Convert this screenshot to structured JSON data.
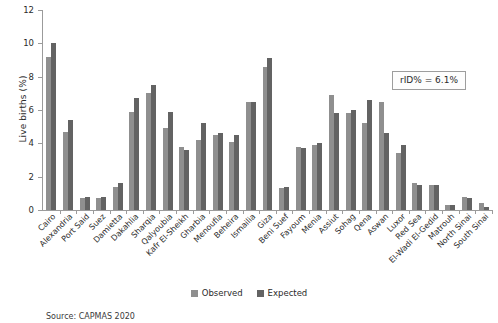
{
  "chart_data": {
    "type": "bar",
    "title": "",
    "xlabel": "",
    "ylabel": "Live births (%)",
    "ylim": [
      0,
      12
    ],
    "yticks": [
      0,
      2,
      4,
      6,
      8,
      10,
      12
    ],
    "grid": false,
    "legend_position": "bottom-center",
    "categories": [
      "Cairo",
      "Alexandria",
      "Port Said",
      "Suez",
      "Damietta",
      "Dakahlia",
      "Sharqia",
      "Qalyoubia",
      "Kafr El-Sheikh",
      "Gharbia",
      "Menoufia",
      "Beheira",
      "Ismailia",
      "Giza",
      "Beni Suef",
      "Fayoum",
      "Menia",
      "Assiut",
      "Sohag",
      "Qena",
      "Aswan",
      "Luxor",
      "Red Sea",
      "El-Wadi El-Gedid",
      "Matrouh",
      "North Sinai",
      "South Sinai"
    ],
    "series": [
      {
        "name": "Observed",
        "color": "#8f8f8f",
        "values": [
          9.2,
          4.7,
          0.7,
          0.7,
          1.4,
          5.9,
          7.0,
          4.9,
          3.8,
          4.2,
          4.5,
          4.1,
          6.5,
          8.6,
          1.3,
          3.8,
          3.9,
          6.9,
          5.8,
          5.2,
          6.5,
          3.4,
          1.6,
          1.5,
          0.3,
          0.8,
          0.4
        ],
        "annotation": ""
      },
      {
        "name": "Expected",
        "color": "#636363",
        "values": [
          10.0,
          5.4,
          0.8,
          0.8,
          1.6,
          6.7,
          7.5,
          5.9,
          3.6,
          5.2,
          4.6,
          4.5,
          6.5,
          9.1,
          1.4,
          3.7,
          4.0,
          5.8,
          6.0,
          6.6,
          4.6,
          3.9,
          1.5,
          1.5,
          0.3,
          0.7,
          0.2
        ],
        "annotation": ""
      }
    ],
    "annotations": [
      {
        "text": "rID% = 6.1%",
        "position": "top-right"
      }
    ],
    "source": "Source: CAPMAS 2020"
  },
  "legend": {
    "items": [
      {
        "label": "Observed",
        "color": "#8f8f8f"
      },
      {
        "label": "Expected",
        "color": "#636363"
      }
    ]
  },
  "annotation_box": {
    "text": "rID% = 6.1%"
  },
  "axis": {
    "y_title": "Live births (%)",
    "y_ticks": [
      "0",
      "2",
      "4",
      "6",
      "8",
      "10",
      "12"
    ]
  },
  "footer": {
    "source": "Source: CAPMAS 2020"
  },
  "colors": {
    "observed": "#8f8f8f",
    "expected": "#636363",
    "axis": "#9b9b9b",
    "text": "#2b2b2b",
    "background": "#ffffff"
  }
}
